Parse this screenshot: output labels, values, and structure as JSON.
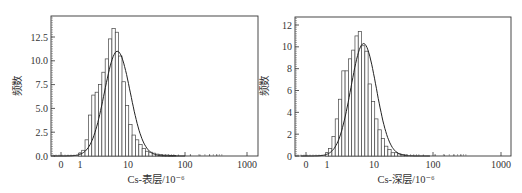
{
  "chart_data": [
    {
      "type": "bar",
      "subtype": "histogram-with-lognormal-fit",
      "title": "",
      "xlabel": "Cs-表层/10⁻⁶",
      "ylabel": "频数",
      "xscale": "log",
      "xticks": [
        "0",
        "1",
        "10",
        "100",
        "1000"
      ],
      "yticks": [
        "0.0",
        "2.5",
        "5.0",
        "7.5",
        "10.0",
        "12.5"
      ],
      "ylim": [
        0,
        14.5
      ],
      "grid": false,
      "legend": null,
      "bins_log10_center": [
        0.0,
        0.07,
        0.14,
        0.21,
        0.28,
        0.35,
        0.42,
        0.49,
        0.56,
        0.63,
        0.7,
        0.77,
        0.84,
        0.91,
        0.98,
        1.05,
        1.12,
        1.19,
        1.26,
        1.33,
        1.4,
        1.47,
        1.54,
        1.61,
        1.68,
        1.75,
        1.82,
        1.89,
        1.96
      ],
      "values": [
        0.3,
        0.6,
        1.7,
        4.3,
        6.4,
        6.7,
        7.5,
        8.8,
        10.2,
        12.3,
        13.4,
        13.0,
        10.5,
        7.8,
        5.3,
        3.3,
        2.2,
        1.7,
        1.2,
        0.8,
        0.5,
        0.4,
        0.3,
        0.2,
        0.15,
        0.1,
        0.1,
        0.05,
        0.05
      ],
      "fit_curve": {
        "type": "normal-on-log",
        "peak": 11.0,
        "peak_x": 6
      }
    },
    {
      "type": "bar",
      "subtype": "histogram-with-lognormal-fit",
      "title": "",
      "xlabel": "Cs-深层/10⁻⁶",
      "ylabel": "频数",
      "xscale": "log",
      "xticks": [
        "0",
        "1",
        "10",
        "100",
        "1000"
      ],
      "yticks": [
        "0",
        "2",
        "4",
        "6",
        "8",
        "10",
        "12"
      ],
      "ylim": [
        0,
        12.7
      ],
      "grid": false,
      "legend": null,
      "bins_log10_center": [
        0.0,
        0.07,
        0.14,
        0.21,
        0.28,
        0.35,
        0.42,
        0.49,
        0.56,
        0.63,
        0.7,
        0.77,
        0.84,
        0.91,
        0.98,
        1.05,
        1.12,
        1.19,
        1.26,
        1.33,
        1.4,
        1.47,
        1.54,
        1.61,
        1.68
      ],
      "values": [
        0.3,
        0.7,
        1.8,
        3.4,
        5.2,
        7.8,
        7.8,
        8.9,
        9.7,
        11.0,
        11.4,
        10.1,
        9.6,
        6.6,
        5.0,
        3.4,
        2.4,
        1.6,
        0.9,
        0.6,
        0.3,
        0.3,
        0.2,
        0.15,
        0.1
      ],
      "fit_curve": {
        "type": "normal-on-log",
        "peak": 10.3,
        "peak_x": 6
      }
    }
  ],
  "labels": {
    "left": {
      "ylabel": "频数",
      "xlabel": "Cs-表层/10⁻⁶",
      "yticks": [
        "0.0",
        "2.5",
        "5.0",
        "7.5",
        "10.0",
        "12.5"
      ],
      "xticks": [
        "0",
        "1",
        "10",
        "100",
        "1000"
      ]
    },
    "right": {
      "ylabel": "频数",
      "xlabel": "Cs-深层/10⁻⁶",
      "yticks": [
        "0",
        "2",
        "4",
        "6",
        "8",
        "10",
        "12"
      ],
      "xticks": [
        "0",
        "1",
        "10",
        "100",
        "1000"
      ]
    }
  }
}
